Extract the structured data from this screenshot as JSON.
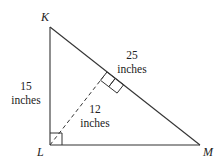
{
  "diagram": {
    "type": "right-triangle-with-altitude",
    "colors": {
      "stroke": "#333333",
      "text": "#222222",
      "background": "#ffffff"
    },
    "vertices": {
      "K": {
        "label": "K",
        "x": 50,
        "y": 27
      },
      "L": {
        "label": "L",
        "x": 50,
        "y": 145
      },
      "M": {
        "label": "M",
        "x": 200,
        "y": 145
      }
    },
    "altitude_foot": {
      "x": 107,
      "y": 72
    },
    "measurements": {
      "KL": {
        "value": "15",
        "unit": "inches"
      },
      "KM": {
        "value": "25",
        "unit": "inches"
      },
      "altitude": {
        "value": "12",
        "unit": "inches"
      }
    },
    "right_angles": [
      "L",
      "altitude-foot"
    ],
    "altitude_style": "dashed"
  }
}
